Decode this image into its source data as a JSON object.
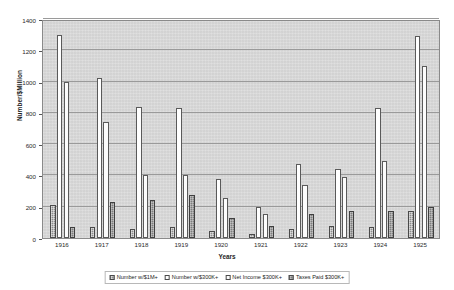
{
  "chart_data": {
    "type": "bar",
    "title": "",
    "xlabel": "Years",
    "ylabel": "Number/$Million",
    "categories": [
      "1916",
      "1917",
      "1918",
      "1919",
      "1920",
      "1921",
      "1922",
      "1923",
      "1924",
      "1925"
    ],
    "ylim": [
      0,
      1400
    ],
    "yticks": [
      0,
      200,
      400,
      600,
      800,
      1000,
      1200,
      1400
    ],
    "grid": true,
    "legend_position": "bottom",
    "series": [
      {
        "name": "Number w/$1M+",
        "values": [
          210,
          70,
          60,
          70,
          45,
          25,
          60,
          75,
          70,
          175
        ]
      },
      {
        "name": "Number w/$300K+",
        "values": [
          1300,
          1020,
          840,
          830,
          375,
          200,
          475,
          440,
          830,
          1290
        ]
      },
      {
        "name": "Net Income $300K+",
        "values": [
          1000,
          740,
          400,
          400,
          255,
          155,
          340,
          390,
          490,
          1100
        ]
      },
      {
        "name": "Taxes Paid $300K+",
        "values": [
          70,
          230,
          240,
          275,
          130,
          75,
          155,
          170,
          175,
          200
        ]
      }
    ]
  },
  "legend": {
    "items": [
      {
        "label": "Number w/$1M+"
      },
      {
        "label": "Number w/$300K+"
      },
      {
        "label": "Net Income $300K+"
      },
      {
        "label": "Taxes Paid $300K+"
      }
    ]
  },
  "colors": {
    "plot_background": "#d8d8d8",
    "gridline": "#9a9a9a",
    "series_1m": "#8d8d8d",
    "series_300k": "#ffffff",
    "series_net_income": "#fcfcfc",
    "series_taxes": "#7e7e7e",
    "axis_text": "#2a2a2a"
  }
}
